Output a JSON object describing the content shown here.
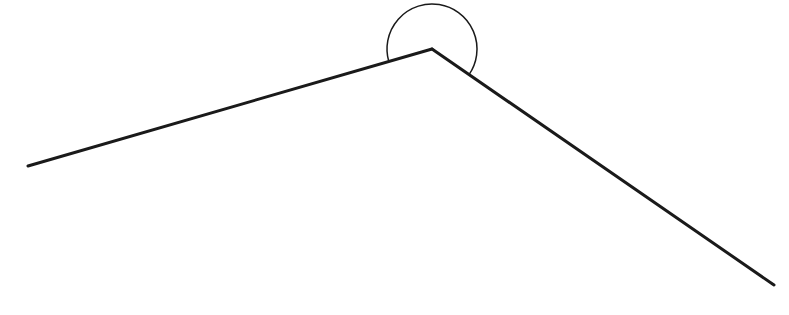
{
  "diagram": {
    "type": "reflex-angle",
    "background": "#ffffff",
    "stroke_color": "#1a1a1a",
    "vertex": {
      "x": 432,
      "y": 49
    },
    "ray_left_end": {
      "x": 28,
      "y": 166
    },
    "ray_right_end": {
      "x": 774,
      "y": 285
    },
    "ray_stroke_width": 3,
    "arc": {
      "radius": 45,
      "stroke_width": 1.5,
      "side": "reflex (above vertex)"
    },
    "labels": []
  }
}
